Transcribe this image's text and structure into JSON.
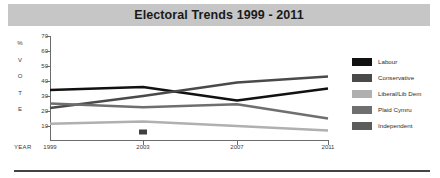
{
  "title": "Electoral Trends 1999 - 2011",
  "axes": {
    "y_letters": [
      "%",
      "V",
      "O",
      "T",
      "E"
    ],
    "y_ticks": [
      70,
      60,
      50,
      40,
      30,
      20,
      10
    ],
    "x_caption": "YEAR",
    "x_ticks": [
      "1999",
      "2003",
      "2007",
      "2011"
    ]
  },
  "legend": {
    "items": [
      {
        "label": "Labour",
        "color": "#111111"
      },
      {
        "label": "Conservative",
        "color": "#4a4a4a"
      },
      {
        "label": "Liberal/Lib Dem",
        "color": "#b0b0b0"
      },
      {
        "label": "Plaid Cymru",
        "color": "#6f6f6f"
      },
      {
        "label": "Independent",
        "color": "#5c5c5c"
      }
    ]
  },
  "chart_data": {
    "type": "line",
    "title": "Electoral Trends 1999 - 2011",
    "xlabel": "YEAR",
    "ylabel": "% VOTE",
    "categories": [
      1999,
      2003,
      2007,
      2011
    ],
    "ylim": [
      0,
      70
    ],
    "xlim": [
      1999,
      2011
    ],
    "grid": false,
    "legend_position": "right",
    "series": [
      {
        "name": "Labour",
        "color": "#111111",
        "values": [
          34,
          36,
          27,
          35
        ]
      },
      {
        "name": "Conservative",
        "color": "#4a4a4a",
        "values": [
          22,
          30,
          39,
          43
        ]
      },
      {
        "name": "Liberal/Lib Dem",
        "color": "#b0b0b0",
        "values": [
          11.5,
          13,
          10,
          7
        ]
      },
      {
        "name": "Plaid Cymru",
        "color": "#6f6f6f",
        "values": [
          25,
          22.5,
          24.5,
          15
        ]
      },
      {
        "name": "Independent",
        "color": "#3f3f3f",
        "values": [
          null,
          6,
          null,
          null
        ]
      }
    ]
  }
}
